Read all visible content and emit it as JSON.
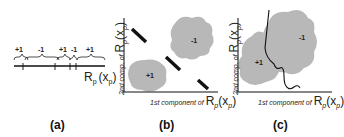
{
  "panels": [
    {
      "id": "a",
      "caption": "(a)",
      "axis_label": "R",
      "axis_label_sub": "p",
      "axis_label_arg": "(x",
      "axis_label_arg_sub": "p",
      "axis_label_close": ")",
      "segments": [
        {
          "label": "+1"
        },
        {
          "label": "-1"
        },
        {
          "label": "+1"
        },
        {
          "label": "-1"
        },
        {
          "label": "+1"
        }
      ]
    },
    {
      "id": "b",
      "caption": "(b)",
      "ylabel_text": "2nd comp. of",
      "xlabel_text": "1st component of",
      "math_R": "R",
      "math_sub": "p",
      "math_arg": "(x",
      "math_arg_sub": "p",
      "math_close": ")",
      "region_pos": "+1",
      "region_neg": "-1"
    },
    {
      "id": "c",
      "caption": "(c)",
      "ylabel_text": "2nd comp. of",
      "xlabel_text": "1st component of",
      "math_R": "R",
      "math_sub": "p",
      "math_arg": "(x",
      "math_arg_sub": "p",
      "math_close": ")",
      "region_pos": "+1",
      "region_neg": "-1"
    }
  ],
  "colors": {
    "region_fill": "#b8b8b8",
    "axis": "#111111",
    "boundary": "#111111"
  }
}
